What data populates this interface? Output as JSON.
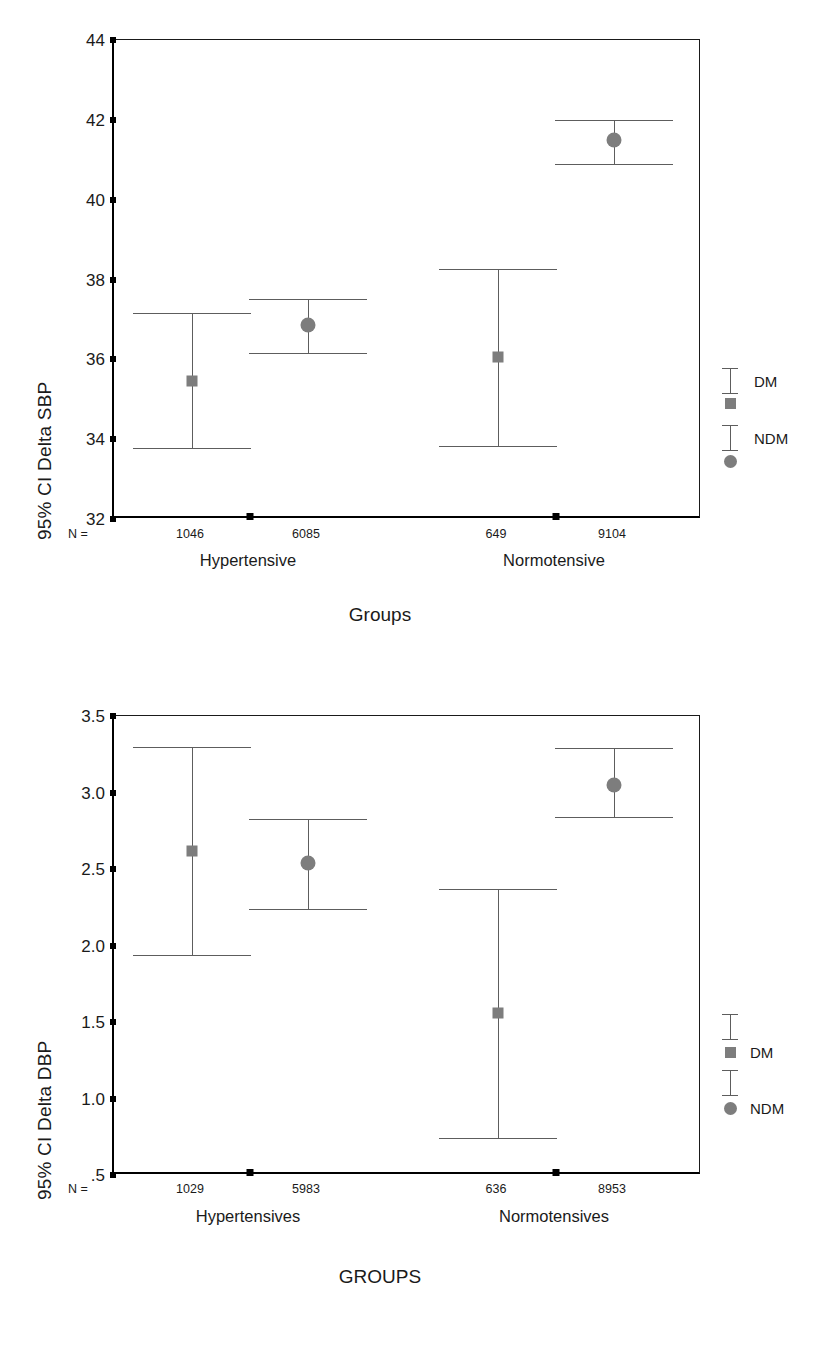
{
  "chart_data": [
    {
      "id": "sbp",
      "type": "errorbar",
      "title": "",
      "xlabel": "Groups",
      "ylabel": "95% CI Delta SBP",
      "ylim": [
        32,
        44
      ],
      "yticks": [
        32,
        34,
        36,
        38,
        40,
        42,
        44
      ],
      "ytick_labels": [
        "32",
        "34",
        "36",
        "38",
        "40",
        "42",
        "44"
      ],
      "grid": false,
      "legend_position": "right",
      "n_prefix": "N =",
      "categories": [
        "Hypertensive",
        "Normotensive"
      ],
      "series": [
        {
          "name": "DM",
          "marker": "square",
          "values": [
            35.45,
            36.05
          ],
          "ci_low": [
            33.78,
            33.82
          ],
          "ci_high": [
            37.15,
            38.27
          ],
          "n": [
            1046,
            649
          ]
        },
        {
          "name": "NDM",
          "marker": "circle",
          "values": [
            36.85,
            41.5
          ],
          "ci_low": [
            36.15,
            40.9
          ],
          "ci_high": [
            37.5,
            42.0
          ],
          "n": [
            6085,
            9104
          ]
        }
      ],
      "points": [
        {
          "group": "Hypertensive",
          "series": "DM",
          "n": "1046",
          "mean": 35.45,
          "low": 33.78,
          "high": 37.15
        },
        {
          "group": "Hypertensive",
          "series": "NDM",
          "n": "6085",
          "mean": 36.85,
          "low": 36.15,
          "high": 37.5
        },
        {
          "group": "Normotensive",
          "series": "DM",
          "n": "649",
          "mean": 36.05,
          "low": 33.82,
          "high": 38.27
        },
        {
          "group": "Normotensive",
          "series": "NDM",
          "n": "9104",
          "mean": 41.5,
          "low": 40.9,
          "high": 42.0
        }
      ],
      "legend": [
        {
          "label": "DM",
          "marker": "square"
        },
        {
          "label": "NDM",
          "marker": "circle"
        }
      ]
    },
    {
      "id": "dbp",
      "type": "errorbar",
      "title": "",
      "xlabel": "GROUPS",
      "ylabel": "95% CI Delta DBP",
      "ylim": [
        0.5,
        3.5
      ],
      "yticks": [
        0.5,
        1.0,
        1.5,
        2.0,
        2.5,
        3.0,
        3.5
      ],
      "ytick_labels": [
        ".5",
        "1.0",
        "1.5",
        "2.0",
        "2.5",
        "3.0",
        "3.5"
      ],
      "grid": false,
      "legend_position": "right",
      "n_prefix": "N =",
      "categories": [
        "Hypertensives",
        "Normotensives"
      ],
      "series": [
        {
          "name": "DM",
          "marker": "square",
          "values": [
            2.62,
            1.56
          ],
          "ci_low": [
            1.94,
            0.74
          ],
          "ci_high": [
            3.3,
            2.37
          ],
          "n": [
            1029,
            636
          ]
        },
        {
          "name": "NDM",
          "marker": "circle",
          "values": [
            2.54,
            3.05
          ],
          "ci_low": [
            2.24,
            2.84
          ],
          "ci_high": [
            2.83,
            3.29
          ],
          "n": [
            5983,
            8953
          ]
        }
      ],
      "points": [
        {
          "group": "Hypertensives",
          "series": "DM",
          "n": "1029",
          "mean": 2.62,
          "low": 1.94,
          "high": 3.3
        },
        {
          "group": "Hypertensives",
          "series": "NDM",
          "n": "5983",
          "mean": 2.54,
          "low": 2.24,
          "high": 2.83
        },
        {
          "group": "Normotensives",
          "series": "DM",
          "n": "636",
          "mean": 1.56,
          "low": 0.74,
          "high": 2.37
        },
        {
          "group": "Normotensives",
          "series": "NDM",
          "n": "8953",
          "mean": 3.05,
          "low": 2.84,
          "high": 3.29
        }
      ],
      "legend": [
        {
          "label": "DM",
          "marker": "square"
        },
        {
          "label": "NDM",
          "marker": "circle"
        }
      ]
    }
  ],
  "colors": {
    "axis": "#000000",
    "marker": "#7d7d7d",
    "errorbar": "#5d5d5d",
    "text": "#1a1a1a",
    "background": "#ffffff"
  }
}
